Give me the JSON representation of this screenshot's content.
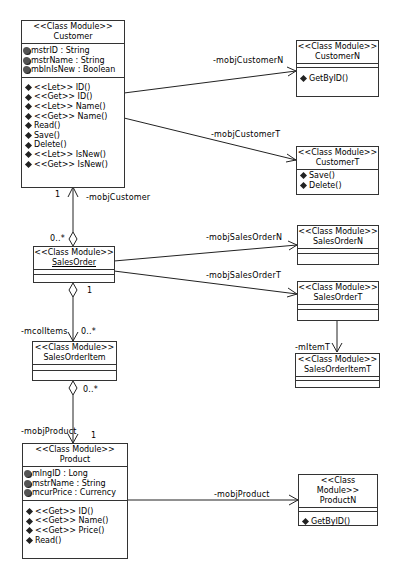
{
  "diagram": {
    "stereotype": "<<Class Module>>",
    "classes": {
      "customer": {
        "name": "Customer",
        "attributes": [
          "mstrID : String",
          "mstrName : String",
          "mblnIsNew : Boolean"
        ],
        "methods": [
          "<<Let>> ID()",
          "<<Get>> ID()",
          "<<Let>> Name()",
          "<<Get>> Name()",
          "Read()",
          "Save()",
          "Delete()",
          "<<Let>> IsNew()",
          "<<Get>> IsNew()"
        ]
      },
      "customerN": {
        "name": "CustomerN",
        "attributes": [],
        "methods": [
          "GetByID()"
        ]
      },
      "customerT": {
        "name": "CustomerT",
        "methods": [
          "Save()",
          "Delete()"
        ]
      },
      "salesOrder": {
        "name": "SalesOrder",
        "attributes": [],
        "methods": []
      },
      "salesOrderN": {
        "name": "SalesOrderN",
        "attributes": [],
        "methods": []
      },
      "salesOrderT": {
        "name": "SalesOrderT",
        "attributes": [],
        "methods": []
      },
      "salesOrderItemT": {
        "name": "SalesOrderItemT",
        "attributes": [],
        "methods": []
      },
      "salesOrderItem": {
        "name": "SalesOrderItem",
        "attributes": [],
        "methods": []
      },
      "product": {
        "name": "Product",
        "attributes": [
          "mlngID : Long",
          "mstrName : String",
          "mcurPrice : Currency"
        ],
        "methods": [
          "<<Get>> ID()",
          "<<Get>> Name()",
          "<<Get>> Price()",
          "Read()"
        ]
      },
      "productN": {
        "name": "ProductN",
        "attributes": [],
        "methods": [
          "GetByID()"
        ]
      }
    },
    "associations": {
      "customerN": {
        "role": "-mobjCustomerN"
      },
      "customerT": {
        "role": "-mobjCustomerT"
      },
      "customer": {
        "role": "-mobjCustomer",
        "source_mult": "1",
        "target_mult": "0..*"
      },
      "salesOrderN": {
        "role": "-mobjSalesOrderN"
      },
      "salesOrderT": {
        "role": "-mobjSalesOrderT"
      },
      "itemT": {
        "role": "-mItemT"
      },
      "items": {
        "role": "-mcolItems",
        "agg_mult": "1",
        "target_mult": "0..*"
      },
      "product": {
        "role": "-mobjProduct",
        "agg_mult": "0..*",
        "target_mult": "1"
      },
      "productN": {
        "role": "-mobjProduct"
      }
    }
  }
}
